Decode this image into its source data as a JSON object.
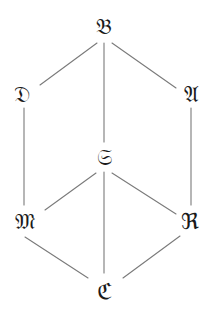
{
  "diagram": {
    "type": "lattice",
    "line_color": "#7a7a7a",
    "text_color": "#1a1a1a",
    "nodes": {
      "B": {
        "label": "𝔅",
        "x": 104,
        "y": 27
      },
      "D": {
        "label": "𝔇",
        "x": 22,
        "y": 95
      },
      "A": {
        "label": "𝔄",
        "x": 191,
        "y": 95
      },
      "S": {
        "label": "𝔖",
        "x": 104,
        "y": 158
      },
      "M": {
        "label": "𝔐",
        "x": 25,
        "y": 222
      },
      "R": {
        "label": "ℜ",
        "x": 190,
        "y": 222
      },
      "E": {
        "label": "ℭ",
        "x": 104,
        "y": 292
      }
    },
    "edges": [
      {
        "from": "B",
        "to": "D"
      },
      {
        "from": "B",
        "to": "A"
      },
      {
        "from": "B",
        "to": "S"
      },
      {
        "from": "D",
        "to": "M"
      },
      {
        "from": "A",
        "to": "R"
      },
      {
        "from": "S",
        "to": "M"
      },
      {
        "from": "S",
        "to": "R"
      },
      {
        "from": "S",
        "to": "E"
      },
      {
        "from": "M",
        "to": "E"
      },
      {
        "from": "R",
        "to": "E"
      }
    ]
  }
}
